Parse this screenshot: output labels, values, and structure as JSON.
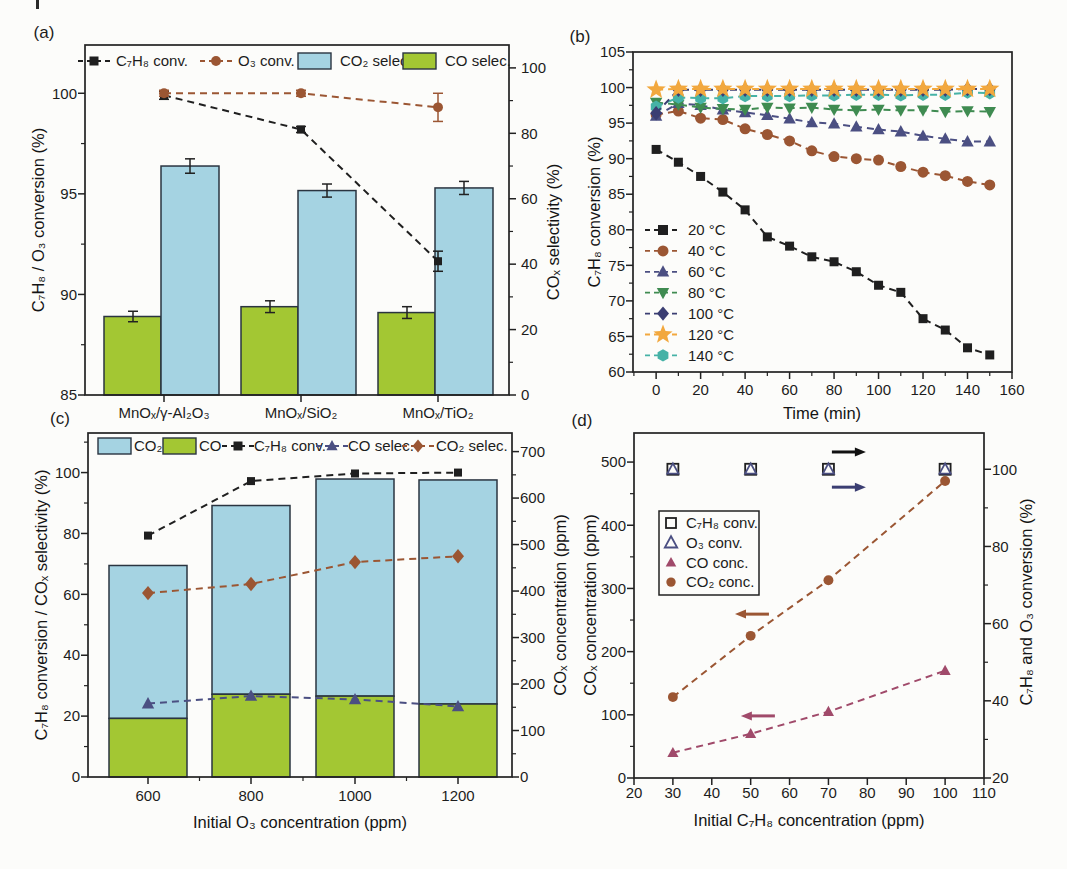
{
  "figure": {
    "background": "#fcfcfa",
    "axis_color": "#222222"
  },
  "chart_data": [
    {
      "panel_label": "(a)",
      "type": "bar+line",
      "categories": [
        "MnOₓ/γ-Al₂O₃",
        "MnOₓ/SiO₂",
        "MnOₓ/TiO₂"
      ],
      "ylabel_left": "C₇H₈ / O₃ conversion (%)",
      "ylabel_right": "COₓ selectivity (%)",
      "ylim_left": [
        85,
        102.4
      ],
      "yticks_left": [
        85,
        90,
        95,
        100
      ],
      "ylim_right": [
        0,
        107
      ],
      "yticks_right": [
        0,
        20,
        40,
        60,
        80,
        100
      ],
      "bar_series": [
        {
          "name": "CO selec.",
          "color": "#a3c733",
          "axis": "right",
          "values": [
            24.0,
            27.0,
            25.2
          ],
          "errors": [
            1.6,
            1.8,
            1.8
          ]
        },
        {
          "name": "CO₂ selec.",
          "color": "#a5d3e2",
          "axis": "right",
          "values": [
            70.0,
            62.5,
            63.3
          ],
          "errors": [
            2.2,
            2.0,
            2.0
          ]
        }
      ],
      "line_series": [
        {
          "name": "C₇H₈ conv.",
          "marker": "square",
          "color": "#1f1f1f",
          "axis": "left",
          "values": [
            99.9,
            98.2,
            91.65
          ],
          "errors": [
            0.2,
            0.15,
            0.5
          ]
        },
        {
          "name": "O₃ conv.",
          "marker": "circle",
          "color": "#9b5633",
          "axis": "left",
          "values": [
            100.0,
            100.0,
            99.3
          ],
          "errors": [
            0.15,
            0.15,
            0.7
          ]
        }
      ],
      "legend": [
        {
          "label": "C₇H₈ conv.",
          "kind": "marker",
          "marker": "square",
          "color": "#1f1f1f"
        },
        {
          "label": "O₃ conv.",
          "kind": "marker",
          "marker": "circle",
          "color": "#9b5633"
        },
        {
          "label": "CO₂ selec.",
          "kind": "box",
          "color": "#a5d3e2"
        },
        {
          "label": "CO selec.",
          "kind": "box",
          "color": "#a3c733"
        }
      ]
    },
    {
      "panel_label": "(b)",
      "type": "line",
      "xlabel": "Time (min)",
      "ylabel_left": "C₇H₈ conversion (%)",
      "x": [
        0,
        10,
        20,
        30,
        40,
        50,
        60,
        70,
        80,
        90,
        100,
        110,
        120,
        130,
        140,
        150
      ],
      "xlim": [
        -10.4,
        160
      ],
      "xticks": [
        0,
        20,
        40,
        60,
        80,
        100,
        120,
        140,
        160
      ],
      "ylim_left": [
        60,
        105
      ],
      "yticks_left": [
        60,
        65,
        70,
        75,
        80,
        85,
        90,
        95,
        100,
        105
      ],
      "series": [
        {
          "name": "20 °C",
          "marker": "square",
          "color": "#1f1f1f",
          "values": [
            91.3,
            89.5,
            87.5,
            85.3,
            82.8,
            79.0,
            77.7,
            76.2,
            75.5,
            74.1,
            72.2,
            71.2,
            67.5,
            65.9,
            63.4,
            62.4
          ]
        },
        {
          "name": "40 °C",
          "marker": "circle",
          "color": "#9b5633",
          "values": [
            96.2,
            96.7,
            95.7,
            95.5,
            94.2,
            93.4,
            92.5,
            91.1,
            90.3,
            90.0,
            89.8,
            88.9,
            88.1,
            87.6,
            86.8,
            86.3
          ]
        },
        {
          "name": "60 °C",
          "marker": "triangle-up",
          "color": "#4b4f82",
          "values": [
            96.0,
            97.8,
            97.5,
            96.9,
            96.5,
            96.1,
            95.6,
            95.1,
            94.9,
            94.5,
            94.1,
            93.8,
            93.2,
            92.8,
            92.4,
            92.4
          ]
        },
        {
          "name": "80 °C",
          "marker": "triangle-down",
          "color": "#3f8b51",
          "values": [
            97.9,
            97.6,
            97.2,
            97.0,
            96.9,
            97.2,
            97.1,
            97.2,
            96.9,
            96.8,
            96.9,
            96.8,
            96.8,
            96.6,
            96.7,
            96.6
          ]
        },
        {
          "name": "100 °C",
          "marker": "diamond",
          "color": "#3b3e72",
          "values": [
            96.4,
            99.7,
            99.7,
            99.7,
            99.7,
            99.7,
            99.7,
            99.7,
            99.7,
            99.7,
            99.7,
            99.7,
            99.7,
            99.7,
            99.8,
            99.8
          ]
        },
        {
          "name": "120 °C",
          "marker": "star",
          "color": "#f2a83e",
          "values": [
            99.7,
            99.8,
            99.8,
            99.8,
            99.8,
            99.8,
            99.8,
            99.8,
            99.8,
            99.8,
            99.8,
            99.8,
            99.8,
            99.8,
            99.8,
            99.8
          ]
        },
        {
          "name": "140 °C",
          "marker": "hexagon",
          "color": "#46b2a6",
          "values": [
            97.3,
            98.6,
            98.5,
            98.5,
            98.8,
            98.8,
            98.8,
            98.9,
            98.9,
            99.0,
            99.0,
            98.9,
            99.0,
            99.0,
            99.3,
            99.2
          ]
        }
      ]
    },
    {
      "panel_label": "(c)",
      "type": "stacked-bar+line",
      "categories": [
        "600",
        "800",
        "1000",
        "1200"
      ],
      "xlabel": "Initial O₃ concentration (ppm)",
      "ylabel_left": "C₇H₈ conversion / COₓ selectivity (%)",
      "ylabel_right": "COₓ concentration (ppm)",
      "ylim_left": [
        0,
        113
      ],
      "yticks_left": [
        0,
        20,
        40,
        60,
        80,
        100
      ],
      "ylim_right": [
        0,
        740
      ],
      "yticks_right": [
        0,
        100,
        200,
        300,
        400,
        500,
        600,
        700
      ],
      "bar_stack": {
        "axis": "right",
        "segments": [
          {
            "name": "CO",
            "color": "#a3c733",
            "values": [
              126,
              178,
              174,
              157
            ]
          },
          {
            "name": "CO₂",
            "color": "#a5d3e2",
            "values": [
              329,
              406,
              467,
              482
            ]
          }
        ]
      },
      "line_series": [
        {
          "name": "C₇H₈ conv.",
          "marker": "square",
          "color": "#1f1f1f",
          "axis": "left",
          "values": [
            79.3,
            97.2,
            99.7,
            100.0
          ]
        },
        {
          "name": "CO selec.",
          "marker": "triangle-up",
          "color": "#4b4f82",
          "axis": "left",
          "values": [
            24.1,
            26.6,
            25.5,
            23.2
          ]
        },
        {
          "name": "CO₂ selec.",
          "marker": "diamond",
          "color": "#9b5633",
          "axis": "left",
          "values": [
            60.4,
            63.4,
            70.6,
            72.5
          ]
        }
      ],
      "legend": [
        {
          "label": "CO₂",
          "kind": "box",
          "color": "#a5d3e2"
        },
        {
          "label": "CO",
          "kind": "box",
          "color": "#a3c733"
        },
        {
          "label": "C₇H₈ conv.",
          "kind": "marker",
          "marker": "square",
          "color": "#1f1f1f"
        },
        {
          "label": "CO selec.",
          "kind": "marker",
          "marker": "triangle-up",
          "color": "#4b4f82"
        },
        {
          "label": "CO₂ selec.",
          "kind": "marker",
          "marker": "diamond",
          "color": "#9b5633"
        }
      ]
    },
    {
      "panel_label": "(d)",
      "type": "scatter",
      "xlabel": "Initial C₇H₈ concentration (ppm)",
      "ylabel_left": "COₓ concentration (ppm)",
      "ylabel_right": "C₇H₈ and O₃ conversion (%)",
      "x": [
        30,
        50,
        70,
        100
      ],
      "xlim": [
        20,
        110
      ],
      "xticks": [
        20,
        30,
        40,
        50,
        60,
        70,
        80,
        90,
        100,
        110
      ],
      "ylim_left": [
        0,
        546
      ],
      "yticks_left": [
        0,
        100,
        200,
        300,
        400,
        500
      ],
      "ylim_right": [
        20,
        109.4
      ],
      "yticks_right": [
        20,
        40,
        60,
        80,
        100
      ],
      "series": [
        {
          "name": "C₇H₈ conv.",
          "marker": "square-open",
          "color": "#1f1f1f",
          "axis": "right",
          "line": false,
          "values": [
            100,
            100,
            100,
            100
          ]
        },
        {
          "name": "O₃ conv.",
          "marker": "triangle-open",
          "color": "#4b4f82",
          "axis": "right",
          "line": false,
          "values": [
            100,
            100,
            100,
            100
          ]
        },
        {
          "name": "CO conc.",
          "marker": "triangle-up",
          "color": "#a04a6a",
          "axis": "left",
          "line": true,
          "values": [
            40,
            70,
            105,
            170
          ]
        },
        {
          "name": "CO₂ conc.",
          "marker": "circle",
          "color": "#9b5633",
          "axis": "left",
          "line": true,
          "values": [
            128,
            225,
            313,
            470
          ]
        }
      ],
      "arrows": [
        {
          "dir": "right",
          "color": "#111111",
          "fx": 0.614,
          "fy": 0.055
        },
        {
          "dir": "right",
          "color": "#3b3e72",
          "fx": 0.614,
          "fy": 0.157
        },
        {
          "dir": "left",
          "color": "#9b5633",
          "fx": 0.337,
          "fy": 0.525
        },
        {
          "dir": "left",
          "color": "#a04a6a",
          "fx": 0.354,
          "fy": 0.82
        }
      ]
    }
  ]
}
